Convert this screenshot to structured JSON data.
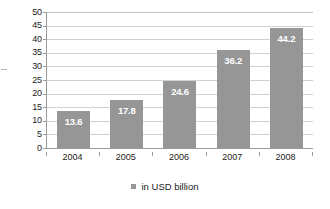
{
  "chart_data": {
    "type": "bar",
    "title": "",
    "subtitle": "",
    "xlabel": "",
    "ylabel": "",
    "categories": [
      "2004",
      "2005",
      "2006",
      "2007",
      "2008"
    ],
    "values": [
      13.6,
      17.8,
      24.6,
      36.2,
      44.2
    ],
    "data_labels": [
      "13.6",
      "17.8",
      "24.6",
      "36.2",
      "44.2"
    ],
    "series": [
      {
        "name": "in USD billion",
        "values": [
          13.6,
          17.8,
          24.6,
          36.2,
          44.2
        ],
        "color": "#969696"
      }
    ],
    "ylim": [
      0,
      50
    ],
    "y_tick_step": 5,
    "y_ticks": [
      "0",
      "5",
      "10",
      "15",
      "20",
      "25",
      "30",
      "35",
      "40",
      "45",
      "50"
    ],
    "grid": true,
    "grid_axis": "y",
    "legend": {
      "position": "bottom",
      "entries": [
        {
          "label": "in USD billion",
          "color": "#969696"
        }
      ]
    },
    "colors": {
      "bar_fill": "#969696",
      "gridline": "#d2d2d2",
      "axis_line": "#9a9a9a",
      "label_text": "#222222",
      "data_label_text": "#ffffff",
      "background": "#ffffff"
    }
  }
}
